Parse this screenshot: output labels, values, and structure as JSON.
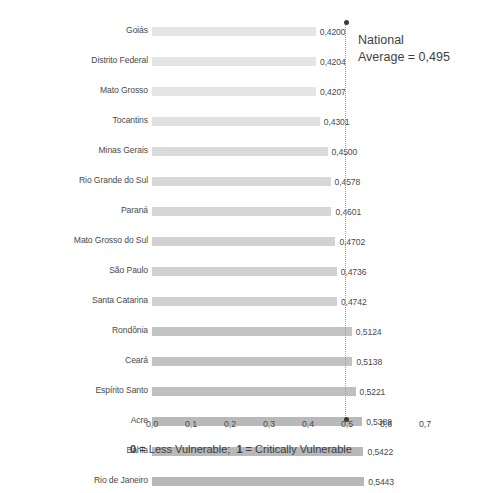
{
  "chart_data": {
    "type": "bar",
    "orientation": "horizontal",
    "title": "",
    "xlabel": "0 = Less Vulnerable;  1 = Critically Vulnerable",
    "ylabel": "",
    "xlim": [
      0.0,
      0.7
    ],
    "xticks": [
      "0,0",
      "0,1",
      "0,2",
      "0,3",
      "0,4",
      "0,5",
      "0,6",
      "0,7"
    ],
    "xtick_values": [
      0.0,
      0.1,
      0.2,
      0.3,
      0.4,
      0.5,
      0.6,
      0.7
    ],
    "grid": false,
    "legend": "none",
    "categories": [
      "Goiás",
      "Distrito Federal",
      "Mato Grosso",
      "Tocantins",
      "Minas Gerais",
      "Rio Grande do Sul",
      "Paraná",
      "Mato Grosso do Sul",
      "São Paulo",
      "Santa Catarina",
      "Rondônia",
      "Ceará",
      "Espírito Santo",
      "Acre",
      "Bahia",
      "Rio de Janeiro",
      "Piauí",
      "Amapá",
      "Rio Grande do Norte",
      "Sergipe",
      "Paraíba",
      "Roraima",
      "Pernambuco",
      "Amazonas",
      "Alagoas",
      "Maranhão",
      "Pará"
    ],
    "values": [
      0.42,
      0.4204,
      0.4207,
      0.4301,
      0.45,
      0.4578,
      0.4601,
      0.4702,
      0.4736,
      0.4742,
      0.5124,
      0.5138,
      0.5221,
      0.5389,
      0.5422,
      0.5443,
      0.5456,
      0.5586,
      0.5613,
      0.5689,
      0.5722,
      0.5775,
      0.5823,
      0.5914,
      0.5938,
      0.5957,
      0.6146
    ],
    "value_labels": [
      "0,4200",
      "0,4204",
      "0,4207",
      "0,4301",
      "0,4500",
      "0,4578",
      "0,4601",
      "0,4702",
      "0,4736",
      "0,4742",
      "0,5124",
      "0,5138",
      "0,5221",
      "0,5389",
      "0,5422",
      "0,5443",
      "0,5456",
      "0,5586",
      "0,5613",
      "0,5689",
      "0,5722",
      "0,5775",
      "0,5823",
      "0,5914",
      "0,5938",
      "0,5957",
      "0,6146"
    ],
    "annotations": [
      {
        "name": "national-average",
        "line1": "National",
        "line2": "Average = 0,495",
        "value": 0.495
      }
    ],
    "colors": {
      "bar_min": "#e5e5e5",
      "bar_max": "#9d9d9d",
      "text": "#4a4a4a",
      "reference_line": "#9a9a9a",
      "marker": "#3a3a3a"
    }
  }
}
